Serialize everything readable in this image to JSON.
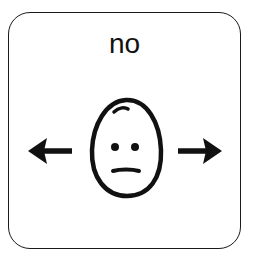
{
  "card": {
    "label": "no",
    "symbol": "face-neutral-with-arrows-left-right",
    "icons": [
      "left-arrow-icon",
      "face-icon",
      "right-arrow-icon"
    ],
    "colors": {
      "stroke": "#111111",
      "background": "#ffffff"
    }
  }
}
